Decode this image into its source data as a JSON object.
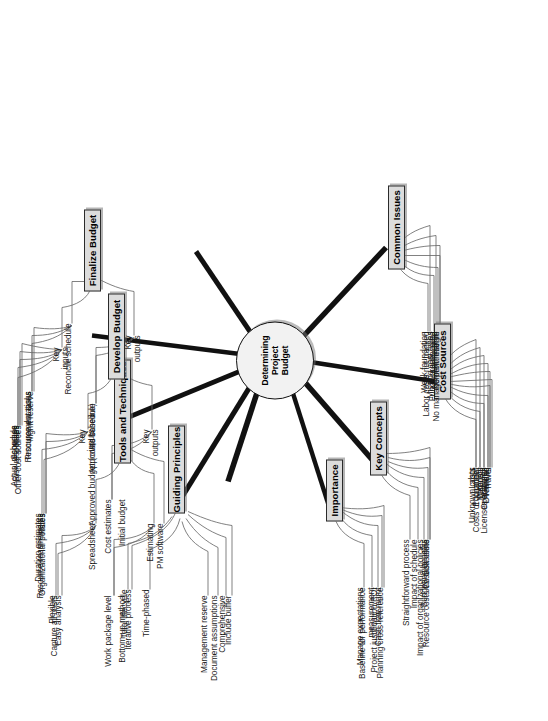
{
  "diagram": {
    "title": "Determining Project Budget",
    "type": "mind-map",
    "orientation": "rotated-90",
    "center": {
      "label": "Determining\nProject\nBudget"
    },
    "colors": {
      "node_fill": "#dcdcdc",
      "node_border": "#2b2b2b",
      "center_fill": "#f2f2f2",
      "connector": "#111111",
      "leaf_text": "#1a1a1a",
      "background": "#ffffff"
    },
    "branches": [
      {
        "id": "guiding-principles",
        "label": "Guiding Principles",
        "leaves": [
          "Iterative process",
          "Total lifecycle",
          "Time-phased",
          "Management reserve",
          "Document assumptions",
          "Comprehensive",
          "Include buffer"
        ]
      },
      {
        "id": "tools-and-techniques",
        "label": "Tools and Techniques",
        "children": [
          {
            "label": "Spreadsheet",
            "leaves": [
              "Capture all costs",
              "Flexible",
              "Easy analysis"
            ]
          },
          {
            "label": "Estimating",
            "leaves": [
              "Work package level",
              "Bottom-up method"
            ]
          },
          {
            "label": "PM software",
            "leaves": []
          }
        ]
      },
      {
        "id": "develop-budget",
        "label": "Develop Budget",
        "children": [
          {
            "label": "Key\ninputs",
            "leaves": [
              "Resource requirements",
              "Duration estimates",
              "Rates",
              "Organizational policies"
            ]
          },
          {
            "label": "Key\noutputs",
            "leaves": [
              "Cost estimates",
              "Initial budget"
            ]
          }
        ]
      },
      {
        "id": "finalize-budget",
        "label": "Finalize Budget",
        "children": [
          {
            "label": "Key\ninputs",
            "leaves": [
              "Actual resources",
              "Schedule",
              "Rates",
              "Risk responses",
              "Other cost sources"
            ]
          },
          {
            "label": "Reconcile schedule",
            "leaves": [
              "Procurement tasks",
              "Resource durations",
              "Mgmt reserve"
            ]
          },
          {
            "label": "Key\noutputs",
            "leaves": [
              "Approved budget (costs baseline)",
              "Approved schedule"
            ]
          }
        ]
      },
      {
        "id": "importance",
        "label": "Importance",
        "leaves": [
          "Manage expectations",
          "Baseline for performance measurement",
          "Project justification/ROI",
          "Cash flow mgmt",
          "Planning cross-reference"
        ]
      },
      {
        "id": "key-concepts",
        "label": "Key Concepts",
        "leaves": [
          "Straightforward process",
          "Impact of schedule",
          "Impact of organizational policies",
          "Budgeting benefits",
          "Cost baseline",
          "Resource costs vs. task costs"
        ]
      },
      {
        "id": "cost-sources",
        "label": "Cost Sources",
        "leaves": [
          "Labor",
          "Equipment",
          "Materials",
          "Licenses and fees",
          "Training",
          "Travel",
          "Overhead",
          "Operational",
          "Disposal",
          "Costs of \"change\"",
          "Unknown costs"
        ]
      },
      {
        "id": "common-issues",
        "label": "Common Issues",
        "leaves": [
          "Weak foundation",
          "Missing cost types",
          "Not full lifecycle",
          "No profit margin",
          "No management reserve",
          "Funds preallocated",
          "Labor costs not tracked"
        ]
      }
    ]
  }
}
